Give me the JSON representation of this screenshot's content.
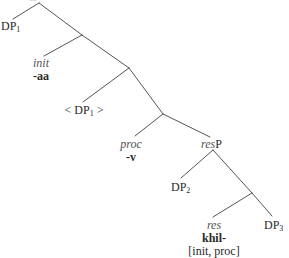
{
  "diagram": {
    "type": "syntax-tree",
    "line_color": "#555555",
    "nodes": {
      "dp1": {
        "base": "DP",
        "sub": "1"
      },
      "init": {
        "category": "init",
        "morpheme": "-aa"
      },
      "dp1_trace": {
        "open": "< DP",
        "sub": "1",
        "close": " >"
      },
      "proc": {
        "category": "proc",
        "morpheme": "-v"
      },
      "resP": {
        "italic": "res",
        "plain": "P"
      },
      "dp2": {
        "base": "DP",
        "sub": "2"
      },
      "res": {
        "category": "res",
        "morpheme": "khil-",
        "features": "[init, proc]"
      },
      "dp3": {
        "base": "DP",
        "sub": "3"
      }
    },
    "edges": [
      {
        "from": "root",
        "to": "dp1"
      },
      {
        "from": "root",
        "to": "n2"
      },
      {
        "from": "n2",
        "to": "init"
      },
      {
        "from": "n2",
        "to": "n3"
      },
      {
        "from": "n3",
        "to": "dp1_trace"
      },
      {
        "from": "n3",
        "to": "n4"
      },
      {
        "from": "n4",
        "to": "proc"
      },
      {
        "from": "n4",
        "to": "resP"
      },
      {
        "from": "resP",
        "to": "dp2"
      },
      {
        "from": "resP",
        "to": "n6"
      },
      {
        "from": "n6",
        "to": "res"
      },
      {
        "from": "n6",
        "to": "dp3"
      }
    ]
  }
}
